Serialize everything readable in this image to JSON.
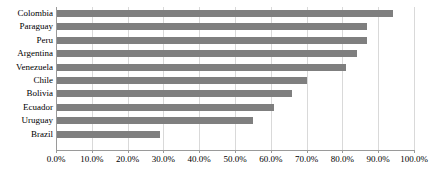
{
  "chart_data": {
    "type": "bar",
    "orientation": "horizontal",
    "title": "",
    "subtitle": "",
    "xlabel": "",
    "ylabel": "",
    "categories": [
      "Colombia",
      "Paraguay",
      "Peru",
      "Argentina",
      "Venezuela",
      "Chile",
      "Bolivia",
      "Ecuador",
      "Uruguay",
      "Brazil"
    ],
    "values": [
      94.0,
      87.0,
      87.0,
      84.0,
      81.0,
      70.0,
      66.0,
      61.0,
      55.0,
      29.0
    ],
    "value_format": "percent",
    "xlim": [
      0.0,
      100.0
    ],
    "xticks": [
      0.0,
      10.0,
      20.0,
      30.0,
      40.0,
      50.0,
      60.0,
      70.0,
      80.0,
      90.0,
      100.0
    ],
    "xtick_labels": [
      "0.0%",
      "10.0%",
      "20.0%",
      "30.0%",
      "40.0%",
      "50.0%",
      "60.0%",
      "70.0%",
      "80.0%",
      "90.0%",
      "100.0%"
    ],
    "grid": "vertical",
    "legend": "none",
    "series": [
      {
        "name": "",
        "color": "#7f7f7f",
        "values": [
          94.0,
          87.0,
          87.0,
          84.0,
          81.0,
          70.0,
          66.0,
          61.0,
          55.0,
          29.0
        ]
      }
    ],
    "colors": {
      "bar": "#7f7f7f",
      "gridline": "#d9d9d9",
      "axis": "#9a9a9a",
      "text": "#000000",
      "background": "#ffffff"
    }
  }
}
